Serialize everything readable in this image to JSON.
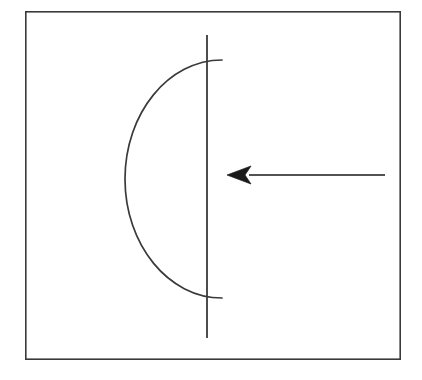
{
  "figure": {
    "title": "",
    "background_color": "#ffffff",
    "stroke_color": "#3a3a3a",
    "frame": {
      "name": "figure-border",
      "x": 25,
      "y": 11,
      "width": 376,
      "height": 349,
      "stroke_width": 1.6,
      "fill": "#ffffff",
      "color": "#3a3a3a"
    },
    "elements": [
      {
        "name": "arc-curve",
        "kind": "arc",
        "description": "leftward-opening arc, convex to the left",
        "start": [
          222,
          60
        ],
        "end": [
          222,
          298
        ],
        "leftmost_point": [
          125,
          179
        ],
        "stroke_width": 1.7,
        "color": "#3a3a3a"
      },
      {
        "name": "vertical-line",
        "kind": "line",
        "description": "vertical straight line crossing the arc near both arc endpoints",
        "x": 207,
        "y_top": 35,
        "y_bottom": 338,
        "stroke_width": 1.8,
        "color": "#3a3a3a"
      },
      {
        "name": "left-arrow",
        "kind": "arrow",
        "description": "horizontal arrow pointing left toward the vertical line",
        "tail": [
          385,
          175
        ],
        "tip": [
          227,
          175
        ],
        "shaft_width": 1.6,
        "head_length": 24,
        "head_half_width": 9,
        "head_notch": 6,
        "color": "#1a1a1a"
      }
    ],
    "labels": []
  },
  "chart_data": {
    "type": "diagram",
    "title": "",
    "xlabel": "",
    "ylabel": "",
    "annotations": [
      "arc opening to the left",
      "vertical line secant to arc",
      "arrow pointing left"
    ]
  }
}
